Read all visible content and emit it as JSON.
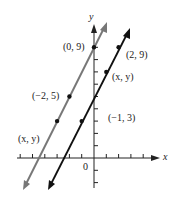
{
  "axes": {
    "x_label": "x",
    "y_label": "y",
    "origin_label": "0"
  },
  "lines": [
    {
      "name": "gray-line",
      "color": "#777777",
      "equation": "y = 2x + 9"
    },
    {
      "name": "black-line",
      "color": "#111111",
      "equation": "y = 2x + 5"
    }
  ],
  "points": [
    {
      "label": "(0, 9)",
      "line": "gray-line"
    },
    {
      "label": "(−2, 5)",
      "line": "gray-line"
    },
    {
      "label": "(x, y)",
      "line": "gray-line"
    },
    {
      "label": "(2, 9)",
      "line": "black-line"
    },
    {
      "label": "(x, y)",
      "line": "black-line"
    },
    {
      "label": "(−1, 3)",
      "line": "black-line"
    }
  ]
}
